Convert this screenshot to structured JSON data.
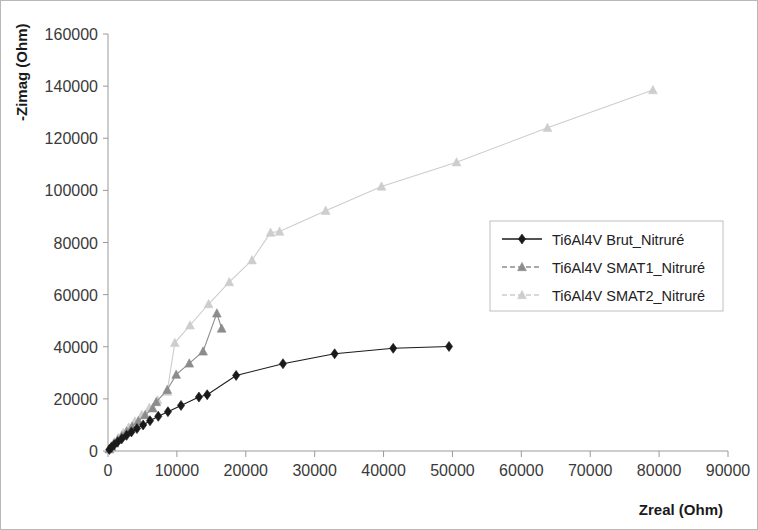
{
  "chart_data": {
    "type": "scatter",
    "title": "",
    "xlabel": "Zreal (Ohm)",
    "ylabel": "-Zimag (Ohm)",
    "xlim": [
      0,
      90000
    ],
    "ylim": [
      0,
      160000
    ],
    "xticks": [
      0,
      10000,
      20000,
      30000,
      40000,
      50000,
      60000,
      70000,
      80000,
      90000
    ],
    "yticks": [
      0,
      20000,
      40000,
      60000,
      80000,
      100000,
      120000,
      140000,
      160000
    ],
    "xtick_labels": [
      "0",
      "10000",
      "20000",
      "30000",
      "40000",
      "50000",
      "60000",
      "70000",
      "80000",
      "90000"
    ],
    "ytick_labels": [
      "0",
      "20000",
      "40000",
      "60000",
      "80000",
      "100000",
      "120000",
      "140000",
      "160000"
    ],
    "grid": false,
    "legend_position": "center-right",
    "series": [
      {
        "name": "Ti6Al4V Brut_Nitruré",
        "color": "#1a1a1a",
        "marker": "diamond",
        "x": [
          200,
          500,
          900,
          1400,
          2000,
          2700,
          3400,
          4200,
          5100,
          6100,
          7300,
          8700,
          10600,
          13200,
          14400,
          18600,
          25400,
          32900,
          41400,
          49500
        ],
        "y": [
          600,
          1400,
          2400,
          3500,
          4700,
          6000,
          7300,
          8600,
          10000,
          11600,
          13300,
          15100,
          17500,
          20700,
          21600,
          29000,
          33500,
          37300,
          39400,
          40100
        ]
      },
      {
        "name": "Ti6Al4V SMAT1_Nitruré",
        "color": "#8c8c8c",
        "marker": "triangle",
        "x": [
          200,
          500,
          900,
          1400,
          2000,
          2700,
          3500,
          4400,
          5400,
          6500,
          7000,
          8600,
          9900,
          11800,
          13800,
          15800,
          16500
        ],
        "y": [
          700,
          1700,
          2900,
          4300,
          5800,
          7500,
          9400,
          11500,
          13800,
          16400,
          18800,
          23500,
          29300,
          33600,
          38200,
          52800,
          47000
        ]
      },
      {
        "name": "Ti6Al4V SMAT2_Nitruré",
        "color": "#cdcdcd",
        "marker": "triangle",
        "x": [
          200,
          500,
          900,
          1500,
          2200,
          3000,
          3900,
          4900,
          6000,
          7200,
          8600,
          9700,
          11900,
          14600,
          17600,
          20900,
          23600,
          24900,
          31600,
          39700,
          50600,
          63800,
          79100
        ],
        "y": [
          800,
          2000,
          3400,
          5100,
          7000,
          9100,
          11400,
          13900,
          16600,
          19500,
          22800,
          41500,
          48200,
          56400,
          64800,
          73200,
          83800,
          84200,
          92200,
          101500,
          110800,
          124000,
          138500
        ]
      }
    ]
  },
  "legend": {
    "items": [
      {
        "label": "Ti6Al4V Brut_Nitruré",
        "color": "#1a1a1a",
        "marker": "diamond"
      },
      {
        "label": "Ti6Al4V SMAT1_Nitruré",
        "color": "#8c8c8c",
        "marker": "triangle"
      },
      {
        "label": "Ti6Al4V SMAT2_Nitruré",
        "color": "#cdcdcd",
        "marker": "triangle"
      }
    ]
  },
  "axes": {
    "x_title": "Zreal (Ohm)",
    "y_title": "-Zimag (Ohm)"
  }
}
